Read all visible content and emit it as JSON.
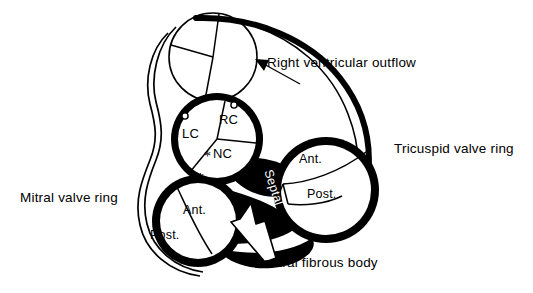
{
  "figure": {
    "type": "anatomical-line-diagram",
    "background": "#ffffff",
    "ink": "#000000"
  },
  "callouts": [
    {
      "id": "rvot",
      "text": "Right ventricular outflow",
      "x": 267,
      "y": 62
    },
    {
      "id": "tricuspid",
      "text": "Tricuspid valve ring",
      "x": 394,
      "y": 148
    },
    {
      "id": "mitral",
      "text": "Mitral valve ring",
      "x": 20,
      "y": 197
    },
    {
      "id": "cfb",
      "text": "Central fibrous body",
      "x": 253,
      "y": 262
    }
  ],
  "valves": {
    "pulmonary": {
      "name": "pulmonary-valve",
      "center": [
        213,
        57
      ],
      "radius": 44,
      "cusps": []
    },
    "aortic": {
      "name": "aortic-valve",
      "center": [
        217,
        139
      ],
      "radius": 40,
      "cusps": [
        {
          "id": "lc",
          "label": "LC",
          "x": 191,
          "y": 135
        },
        {
          "id": "rc",
          "label": "RC",
          "x": 230,
          "y": 121
        },
        {
          "id": "nc",
          "label": "NC",
          "x": 225,
          "y": 155
        }
      ],
      "ostia": [
        {
          "id": "left-coronary-ostium",
          "x": 185,
          "y": 116
        },
        {
          "id": "right-coronary-ostium",
          "x": 234,
          "y": 105
        }
      ]
    },
    "mitral": {
      "name": "mitral-valve",
      "center": [
        198,
        221
      ],
      "radius": 38,
      "leaflets": [
        {
          "id": "mitral-ant",
          "label": "Ant.",
          "x": 190,
          "y": 212
        },
        {
          "id": "mitral-post",
          "label": "Post.",
          "x": 157,
          "y": 236
        }
      ]
    },
    "tricuspid": {
      "name": "tricuspid-valve",
      "center": [
        326,
        190
      ],
      "radius": 45,
      "leaflets": [
        {
          "id": "tricuspid-ant",
          "label": "Ant.",
          "x": 305,
          "y": 161
        },
        {
          "id": "tricuspid-post",
          "label": "Post.",
          "x": 313,
          "y": 196
        },
        {
          "id": "tricuspid-septal",
          "label": "Septal",
          "x": 278,
          "y": 175
        }
      ]
    }
  },
  "markers": {
    "asterisks": [
      {
        "id": "asterisk-aortic-mitral-continuity",
        "symbol": "*",
        "x": 207,
        "y": 157
      },
      {
        "id": "asterisk-mitral-ring",
        "symbol": "*",
        "x": 200,
        "y": 179
      }
    ]
  },
  "arrows": [
    {
      "id": "rvot-arrow",
      "style": "thin-line",
      "from": [
        300,
        84
      ],
      "to": [
        258,
        61
      ]
    },
    {
      "id": "cfb-arrow",
      "style": "white-filled",
      "from": [
        279,
        257
      ],
      "to": [
        248,
        203
      ]
    }
  ]
}
